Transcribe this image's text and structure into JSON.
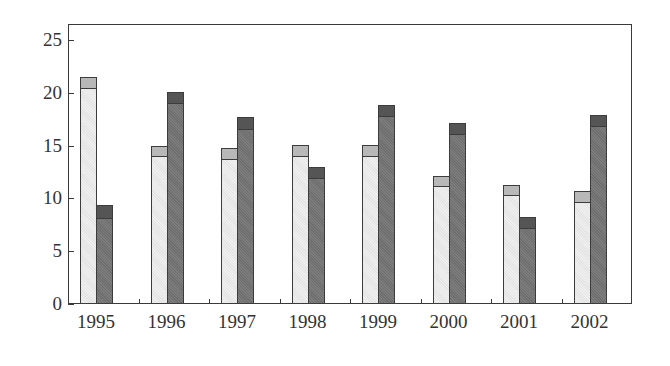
{
  "chart_data": {
    "type": "bar",
    "title": "",
    "xlabel": "",
    "ylabel": "",
    "ylim": [
      0,
      26
    ],
    "yticks": [
      0,
      5,
      10,
      15,
      20,
      25
    ],
    "grid": false,
    "legend": null,
    "categories": [
      "1995",
      "1996",
      "1997",
      "1998",
      "1999",
      "2000",
      "2001",
      "2002"
    ],
    "series": [
      {
        "name": "Series A (light)",
        "color": "#ececec",
        "cap_color": "#b8b8b8",
        "values": [
          21.5,
          15.0,
          14.8,
          15.1,
          15.1,
          12.1,
          11.3,
          10.7
        ],
        "inner_values": [
          20.5,
          14.0,
          13.7,
          14.0,
          14.0,
          11.2,
          10.3,
          9.7
        ]
      },
      {
        "name": "Series B (dark)",
        "color": "#777777",
        "cap_color": "#555555",
        "values": [
          9.4,
          20.1,
          17.7,
          13.0,
          18.8,
          17.1,
          8.2,
          17.9
        ],
        "inner_values": [
          8.1,
          19.0,
          16.6,
          11.9,
          17.8,
          16.1,
          7.2,
          16.9
        ]
      }
    ]
  }
}
